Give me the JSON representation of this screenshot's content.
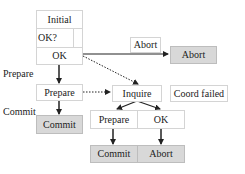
{
  "diagram": {
    "nodes": {
      "initial": "Initial",
      "ok_q": "OK?",
      "ok": "OK",
      "prepare": "Prepare",
      "commit": "Commit",
      "abort_label": "Abort",
      "abort": "Abort",
      "inquire": "Inquire",
      "coord_failed": "Coord failed",
      "prepare2": "Prepare",
      "ok2": "OK",
      "commit2": "Commit",
      "abort2": "Abort"
    },
    "edge_labels": {
      "prepare": "Prepare",
      "commit": "Commit"
    },
    "colors": {
      "box_border": "#d4d4d4",
      "final_fill": "#d8d8d8",
      "arrow": "#222222"
    }
  }
}
